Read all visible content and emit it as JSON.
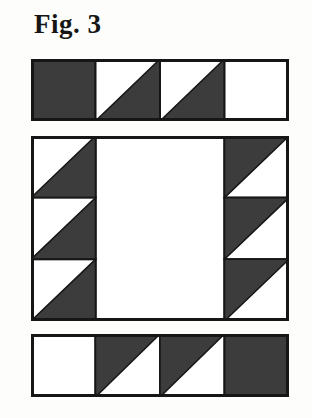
{
  "figure": {
    "label": "Fig. 3"
  },
  "colors": {
    "dark": "#3c3c3c",
    "light": "#ffffff",
    "outline": "#161616",
    "page_bg": "#fdfdfc"
  },
  "quilt": {
    "top_strip": {
      "cells": [
        "dark-square",
        "hst-dark-bottom-right",
        "hst-dark-bottom-right",
        "light-square"
      ]
    },
    "middle_block": {
      "left_column": [
        "hst-dark-bottom-right",
        "hst-dark-bottom-right",
        "hst-dark-bottom-right"
      ],
      "center": "light-square",
      "right_column": [
        "hst-dark-top-left",
        "hst-dark-top-left",
        "hst-dark-top-left"
      ]
    },
    "bottom_strip": {
      "cells": [
        "light-square",
        "hst-dark-top-left",
        "hst-dark-top-left",
        "dark-square"
      ]
    }
  }
}
